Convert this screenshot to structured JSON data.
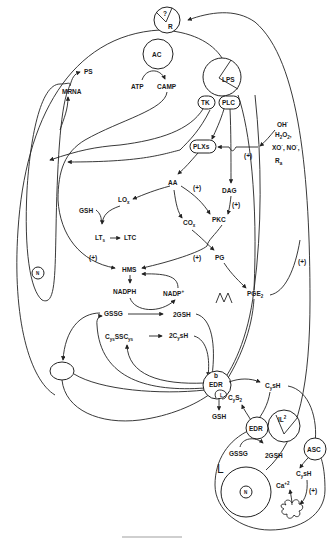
{
  "diagram": {
    "nodes": {
      "receptor": {
        "top": "?",
        "bottom": "R"
      },
      "ac": "AC",
      "atp": "ATP",
      "camp": "CAMP",
      "lps": "LPS",
      "tk": "TK",
      "plc": "PLC",
      "ps": "PS",
      "mrna": "MRNA",
      "plxs": "PLXs",
      "oxidants": {
        "oh": "OH",
        "oh_sup": "·",
        "h2o2": "H",
        "h2o2_sub": "2",
        "h2o2_o": "O",
        "h2o2_sub2": "2",
        "h2o2_comma": ",",
        "xo": "XO",
        "xo_sup": "·",
        "no": ", NO",
        "no_sup": "·",
        "no_comma": ",",
        "ra": "R",
        "ra_sub": "a"
      },
      "aa": "AA",
      "dag": "DAG",
      "lox": "LO",
      "lox_sub": "x",
      "gsh_upper": "GSH",
      "lts": "LT",
      "lts_sub": "s",
      "ltc": "LTC",
      "cox": "CO",
      "cox_sub": "x",
      "pkc": "PKC",
      "pg": "PG",
      "hms": "HMS",
      "nadph": "NADPH",
      "nadp": "NADP",
      "nadp_sup": "+",
      "pge2": "PGE",
      "pge2_sub": "2",
      "nucleus_macrophage": "N",
      "macrophage_label": "M",
      "gssg": "GSSG",
      "gsh2": "2GSH",
      "cysscys": {
        "c1": "C",
        "s1": "ys",
        "mid": "SSC",
        "s2": "ys"
      },
      "cysh2": {
        "pre": "2C",
        "sub": "y",
        "post": "sH"
      },
      "edr_b": {
        "top": "b",
        "label": "EDR",
        "inner": "L"
      },
      "cysh": {
        "pre": "C",
        "sub": "y",
        "post": "sH"
      },
      "cys2": {
        "pre": "C",
        "sub": "y",
        "mid": "S",
        "sub2": "2"
      },
      "gsh_lower": "GSH",
      "edr_l": "EDR",
      "il2": {
        "label": "IL",
        "sup": "2"
      },
      "asc": "ASC",
      "gssg_l": "GSSG",
      "gsh2_l": "2GSH",
      "lymphocyte_label": "L",
      "nucleus_lymphocyte": "N",
      "cysh_l": {
        "pre": "C",
        "sub": "y",
        "post": "sH"
      },
      "ca": {
        "pre": "Ca",
        "sup": "+2"
      }
    },
    "modifiers": {
      "plus_plxs": "(+)",
      "plus_aa_pkc": "(+)",
      "plus_dag_pkc": "(+)",
      "plus_hms_left": "(+)",
      "plus_pg": "(+)",
      "plus_right": "(+)",
      "plus_ca": "(+)"
    }
  }
}
